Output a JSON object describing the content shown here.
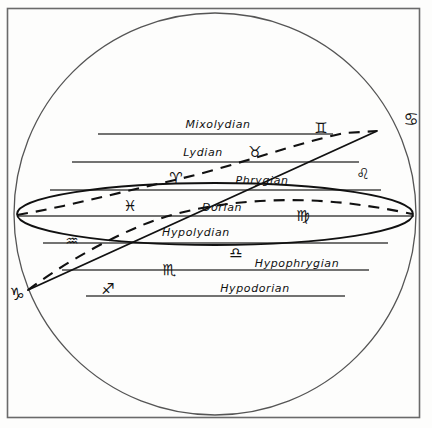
{
  "figure": {
    "background_color": "#fdfdfc",
    "ink_color": "#111111",
    "border_color": "#6a6a6a"
  },
  "chart_data": {
    "type": "diagram",
    "geometry": {
      "frame": {
        "x": 7,
        "y": 8,
        "width": 413,
        "height": 410
      },
      "circle": {
        "cx": 215,
        "cy": 214,
        "r": 201,
        "label": "celestial sphere outline"
      },
      "ellipse": {
        "cx": 215,
        "cy": 214,
        "rx": 198,
        "ry": 31,
        "rotation_deg": 0,
        "label": "horizon / celestial equator ellipse"
      },
      "diagonal_line": {
        "x1": 28,
        "y1": 290,
        "x2": 377,
        "y2": 131,
        "label": "ecliptic (solid straight chord)"
      },
      "dashed_arc": {
        "label": "ecliptic projection (dashed curve)",
        "points": [
          [
            17,
            215
          ],
          [
            60,
            204
          ],
          [
            110,
            193
          ],
          [
            160,
            183
          ],
          [
            200,
            174
          ],
          [
            250,
            159
          ],
          [
            300,
            144
          ],
          [
            350,
            134
          ],
          [
            377,
            131
          ]
        ]
      },
      "dashed_arc_lower": {
        "label": "ecliptic projection lower branch (dashed curve)",
        "points": [
          [
            28,
            290
          ],
          [
            60,
            268
          ],
          [
            95,
            248
          ],
          [
            130,
            231
          ],
          [
            175,
            214
          ],
          [
            230,
            203
          ],
          [
            290,
            200
          ],
          [
            345,
            204
          ],
          [
            400,
            213
          ]
        ]
      }
    },
    "parallel_lines": [
      {
        "index": 0,
        "y": 134,
        "x1": 98,
        "x2": 333,
        "mode": "Mixolydian"
      },
      {
        "index": 1,
        "y": 162,
        "x1": 72,
        "x2": 359,
        "mode": "Lydian"
      },
      {
        "index": 2,
        "y": 190,
        "x1": 50,
        "x2": 381,
        "mode": "Phrygian"
      },
      {
        "index": 3,
        "y": 216,
        "x1": 17,
        "x2": 414,
        "mode": "Dorian"
      },
      {
        "index": 4,
        "y": 243,
        "x1": 43,
        "x2": 388,
        "mode": "Hypolydian"
      },
      {
        "index": 5,
        "y": 270,
        "x1": 62,
        "x2": 369,
        "mode": "Hypophrygian"
      },
      {
        "index": 6,
        "y": 296,
        "x1": 86,
        "x2": 345,
        "mode": "Hypodorian"
      }
    ],
    "mode_labels": [
      {
        "text": "Mixolydian",
        "x": 218,
        "y": 124
      },
      {
        "text": "Lydian",
        "x": 203,
        "y": 152
      },
      {
        "text": "Phrygian",
        "x": 262,
        "y": 180
      },
      {
        "text": "Dorian",
        "x": 222,
        "y": 207
      },
      {
        "text": "Hypolydian",
        "x": 196,
        "y": 232
      },
      {
        "text": "Hypophrygian",
        "x": 297,
        "y": 263
      },
      {
        "text": "Hypodorian",
        "x": 255,
        "y": 288
      }
    ],
    "zodiac_signs": [
      {
        "name": "Gemini",
        "glyph": "♊",
        "x": 321,
        "y": 128
      },
      {
        "name": "Cancer",
        "glyph": "♋",
        "x": 411,
        "y": 119
      },
      {
        "name": "Taurus",
        "glyph": "♉",
        "x": 255,
        "y": 152
      },
      {
        "name": "Leo",
        "glyph": "♌",
        "x": 363,
        "y": 174
      },
      {
        "name": "Aries",
        "glyph": "♈",
        "x": 176,
        "y": 178
      },
      {
        "name": "Pisces",
        "glyph": "♓",
        "x": 130,
        "y": 206
      },
      {
        "name": "Virgo",
        "glyph": "♍",
        "x": 303,
        "y": 216
      },
      {
        "name": "Aquarius",
        "glyph": "♒",
        "x": 72,
        "y": 241
      },
      {
        "name": "Libra",
        "glyph": "♎",
        "x": 236,
        "y": 253
      },
      {
        "name": "Scorpio",
        "glyph": "♏",
        "x": 169,
        "y": 270
      },
      {
        "name": "Sagittarius",
        "glyph": "♐",
        "x": 108,
        "y": 289
      },
      {
        "name": "Capricorn",
        "glyph": "♑",
        "x": 17,
        "y": 294
      }
    ],
    "xlabel": "",
    "ylabel": "",
    "grid": false,
    "legend": "none"
  }
}
